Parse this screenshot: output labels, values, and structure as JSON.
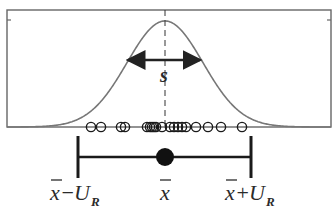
{
  "diagram": {
    "frame": {
      "left": 7,
      "right": 331,
      "top": 10,
      "bottom": 127,
      "stroke": "#666666"
    },
    "curve": {
      "mean_x": 165,
      "peak_y": 21,
      "base_y": 127,
      "sigma_px": 38,
      "stroke": "#777777"
    },
    "mean_dashed_line": {
      "x": 165
    },
    "spread_arrow": {
      "x1": 126,
      "x2": 202,
      "y": 60,
      "label": "s"
    },
    "sample_points_x": [
      91,
      101,
      121,
      125,
      147,
      150,
      152,
      154,
      156,
      162,
      170,
      174,
      178,
      182,
      186,
      196,
      208,
      221,
      242
    ],
    "sample_points_y": 127,
    "interval": {
      "left_x": 78,
      "right_x": 251,
      "center_x": 165,
      "y": 157,
      "cap_top": 136,
      "cap_bottom": 178,
      "dot_radius": 9,
      "labels": {
        "left_main": "x̄ −U",
        "left_sub": "R",
        "center": "x̄",
        "right_main": "x̄ +U",
        "right_sub": "R"
      }
    },
    "colors": {
      "ink": "#1a1a1a",
      "curve": "#777777",
      "frame": "#666666"
    }
  }
}
